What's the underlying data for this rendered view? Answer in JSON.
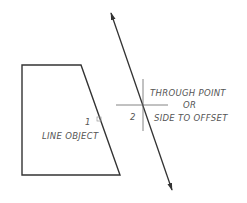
{
  "diagram": {
    "type": "cad-offset-illustration",
    "colors": {
      "background": "#ffffff",
      "line": "#333333",
      "text": "#555555",
      "crosshair": "#666666"
    },
    "labels": {
      "point1_number": "1",
      "line_object": "LINE OBJECT",
      "point2_number": "2",
      "through_point_line1": "THROUGH POINT",
      "through_point_line2": "OR",
      "through_point_line3": "SIDE TO OFFSET"
    },
    "shapes": {
      "polygon": [
        [
          22,
          65
        ],
        [
          81,
          65
        ],
        [
          120,
          175
        ],
        [
          22,
          175
        ]
      ],
      "offset_line": {
        "start": [
          111,
          13
        ],
        "end": [
          172,
          190
        ]
      },
      "crosshair": {
        "center": [
          143,
          105
        ],
        "h_half": 27,
        "v_half": 26
      }
    }
  }
}
